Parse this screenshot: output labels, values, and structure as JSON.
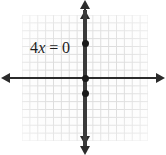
{
  "figure": {
    "type": "coordinate-plane-graph",
    "equation_label": {
      "coefficient": "4",
      "variable": "x",
      "relation": "=",
      "value": "0",
      "full": "4x = 0"
    },
    "axes": {
      "x_axis_name": "x-axis",
      "y_axis_name": "y-axis",
      "arrows": "both-ends"
    },
    "grid": {
      "visible": "true",
      "columns": "16",
      "rows": "16",
      "color": "#d8d8d8"
    },
    "colors": {
      "axis": "#2b2b2b",
      "line": "#3a3a3a",
      "point": "#1a1a1a",
      "grid": "#d8d8d8",
      "background": "#ffffff"
    }
  },
  "chart_data": {
    "type": "line",
    "title": "",
    "xlabel": "",
    "ylabel": "",
    "xlim": [
      -8,
      8
    ],
    "ylim": [
      -8,
      8
    ],
    "grid": "on",
    "legend": "none",
    "equation": "4x = 0",
    "solved_form": "x = 0",
    "series": [
      {
        "name": "4x = 0",
        "kind": "vertical-line",
        "x": [
          0,
          0
        ],
        "y": [
          -8,
          8
        ]
      }
    ],
    "points": [
      {
        "label": "upper-point",
        "x": 0,
        "y": 4
      },
      {
        "label": "origin-point",
        "x": 0,
        "y": 0
      },
      {
        "label": "lower-point",
        "x": 0,
        "y": -2
      }
    ],
    "annotations": [
      {
        "text": "4x = 0",
        "x": -6,
        "y": 4
      }
    ]
  }
}
